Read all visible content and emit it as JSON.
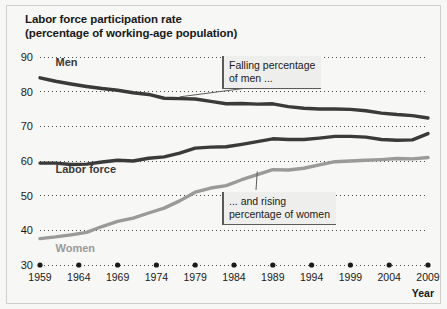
{
  "figure": {
    "title_line1": "Labor force participation rate",
    "title_line2": "(percentage of working-age population)",
    "background_color": "#f7f7f5",
    "border_color": "#cfcfcb"
  },
  "annotations": {
    "men_callout": {
      "line1": "Falling percentage",
      "line2": "of men ..."
    },
    "women_callout": {
      "line1": "... and rising",
      "line2": "percentage of women"
    }
  },
  "series_labels": {
    "men": "Men",
    "labor_force": "Labor force",
    "women": "Women"
  },
  "axis_caption": {
    "x_caption": "Year"
  },
  "chart_data": {
    "type": "line",
    "title": "Labor force participation rate (percentage of working-age population)",
    "xlabel": "Year",
    "ylabel": "",
    "xlim": [
      1959,
      2009
    ],
    "ylim": [
      30,
      90
    ],
    "yticks": [
      30,
      40,
      50,
      60,
      70,
      80,
      90
    ],
    "xticks": [
      1959,
      1964,
      1969,
      1974,
      1979,
      1984,
      1989,
      1994,
      1999,
      2004,
      2009
    ],
    "grid": "horizontal-dotted",
    "legend": "inline-labels",
    "x": [
      1959,
      1961,
      1963,
      1965,
      1967,
      1969,
      1971,
      1973,
      1975,
      1977,
      1979,
      1981,
      1983,
      1985,
      1987,
      1989,
      1991,
      1993,
      1995,
      1997,
      1999,
      2001,
      2003,
      2005,
      2007,
      2009
    ],
    "series": [
      {
        "name": "Men",
        "color": "#3a3a3a",
        "values": [
          84.0,
          83.0,
          82.2,
          81.5,
          80.9,
          80.4,
          79.7,
          79.2,
          78.1,
          78.0,
          77.9,
          77.2,
          76.5,
          76.6,
          76.4,
          76.5,
          75.7,
          75.2,
          75.0,
          75.0,
          74.9,
          74.5,
          73.8,
          73.4,
          73.1,
          72.4
        ]
      },
      {
        "name": "Labor force",
        "color": "#3a3a3a",
        "values": [
          59.4,
          59.4,
          59.0,
          59.1,
          59.7,
          60.2,
          60.0,
          60.8,
          61.2,
          62.3,
          63.7,
          64.0,
          64.1,
          64.8,
          65.6,
          66.4,
          66.2,
          66.2,
          66.6,
          67.1,
          67.1,
          66.9,
          66.2,
          66.0,
          66.1,
          67.9
        ]
      },
      {
        "name": "Women",
        "color": "#9a9a9a",
        "values": [
          37.6,
          38.1,
          38.7,
          39.4,
          41.1,
          42.6,
          43.5,
          45.0,
          46.4,
          48.5,
          51.0,
          52.2,
          52.9,
          54.6,
          56.1,
          57.5,
          57.4,
          57.9,
          58.9,
          59.8,
          60.0,
          60.2,
          60.4,
          60.7,
          60.6,
          61.0
        ]
      }
    ],
    "series_inline_labels": [
      {
        "name": "Men",
        "x": 1961,
        "y": 87.5
      },
      {
        "name": "Labor force",
        "x": 1961,
        "y": 56.5
      },
      {
        "name": "Women",
        "x": 1961,
        "y": 33.8
      }
    ],
    "annotations": [
      {
        "text": "Falling percentage of men ...",
        "target_x": 1977,
        "target_y": 78.5
      },
      {
        "text": "... and rising percentage of women",
        "target_x": 1987,
        "target_y": 57.0
      }
    ]
  }
}
